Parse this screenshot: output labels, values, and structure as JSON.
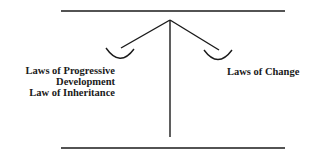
{
  "diagram": {
    "type": "balance-scale",
    "stroke_color": "#1a1a1a",
    "left_pan": {
      "lines": [
        "Laws of Progressive",
        "Development",
        "Law of Inheritance"
      ]
    },
    "right_pan": {
      "lines": [
        "Laws of Change"
      ]
    }
  }
}
